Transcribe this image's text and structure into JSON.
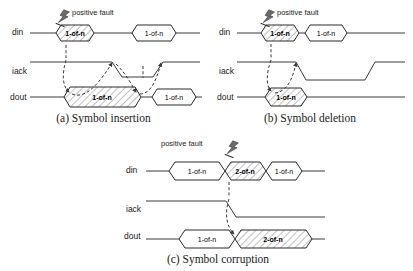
{
  "figure": {
    "signal_labels": {
      "din": "din",
      "iack": "iack",
      "dout": "dout"
    },
    "fault_annotation": "positive fault",
    "fault_icon": "lightning-bolt-icon",
    "colors": {
      "line": "#3a3a3a",
      "hatch": "#8c8c8c",
      "text": "#1a1a1a",
      "background": "#ffffff",
      "bolt": "#6b6b6b"
    },
    "panels": [
      {
        "id": "a",
        "caption": "(a) Symbol insertion",
        "fault_label": "positive fault",
        "fault_label_side": "right",
        "rows": [
          {
            "signal": "din",
            "symbols": [
              {
                "label": "1-of-n",
                "hatched": true,
                "bold": true
              },
              {
                "label": "1-of-n",
                "hatched": false,
                "bold": false
              }
            ]
          },
          {
            "signal": "iack",
            "symbols": []
          },
          {
            "signal": "dout",
            "symbols": [
              {
                "label": "1-of-n",
                "hatched": true,
                "bold": true
              },
              {
                "label": "1-of-n",
                "hatched": false,
                "bold": false
              }
            ]
          }
        ]
      },
      {
        "id": "b",
        "caption": "(b) Symbol deletion",
        "fault_label": "positive fault",
        "fault_label_side": "right",
        "rows": [
          {
            "signal": "din",
            "symbols": [
              {
                "label": "1-of-n",
                "hatched": true,
                "bold": true
              },
              {
                "label": "1-of-n",
                "hatched": false,
                "bold": false
              }
            ]
          },
          {
            "signal": "iack",
            "symbols": []
          },
          {
            "signal": "dout",
            "symbols": [
              {
                "label": "1-of-n",
                "hatched": true,
                "bold": true
              }
            ]
          }
        ]
      },
      {
        "id": "c",
        "caption": "(c) Symbol corruption",
        "fault_label": "positive fault",
        "fault_label_side": "left",
        "rows": [
          {
            "signal": "din",
            "symbols": [
              {
                "label": "1-of-n",
                "hatched": false,
                "bold": false
              },
              {
                "label": "2-of-n",
                "hatched": true,
                "bold": true
              },
              {
                "label": "1-of-n",
                "hatched": false,
                "bold": false
              }
            ]
          },
          {
            "signal": "iack",
            "symbols": []
          },
          {
            "signal": "dout",
            "symbols": [
              {
                "label": "1-of-n",
                "hatched": false,
                "bold": false
              },
              {
                "label": "2-of-n",
                "hatched": true,
                "bold": true
              }
            ]
          }
        ]
      }
    ]
  }
}
